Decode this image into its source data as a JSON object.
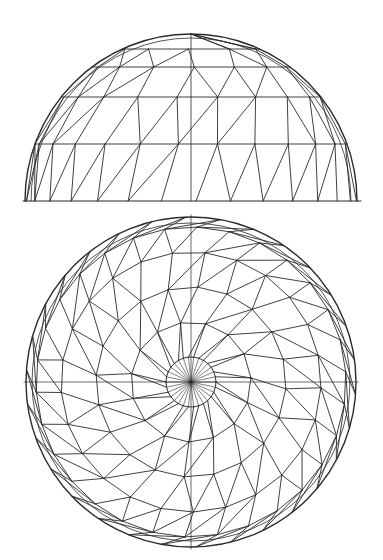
{
  "diagram": {
    "type": "geodesic-dome-drawing",
    "stroke_color": "#2b2b2b",
    "background": "#ffffff",
    "elevation": {
      "center_x": 191,
      "base_y": 201,
      "half_width": 166,
      "height": 167,
      "ring_ys": [
        34,
        49,
        67,
        97,
        144,
        201
      ],
      "ring_node_counts": [
        1,
        10,
        15,
        20,
        25,
        30
      ],
      "ring_rotation": 0.35
    },
    "plan": {
      "center_x": 191,
      "center_y": 382,
      "outer_radius": 165,
      "inner_circle_radius": 25,
      "spokes": 30,
      "ring_radii": [
        25,
        60,
        95,
        130,
        155,
        165
      ],
      "ring_node_counts": [
        30,
        15,
        20,
        25,
        30,
        30
      ],
      "spiral_twist": 0.35
    }
  }
}
